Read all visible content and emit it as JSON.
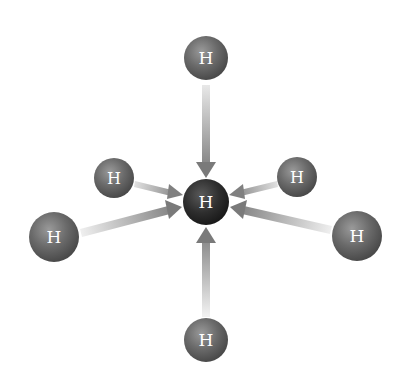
{
  "diagram": {
    "type": "molecular-interaction",
    "center_atom": {
      "label": "H",
      "x": 206,
      "y": 202,
      "r": 23,
      "fill": "#2e2e2e"
    },
    "outer_atoms": [
      {
        "id": "top",
        "label": "H",
        "x": 206,
        "y": 58,
        "r": 22
      },
      {
        "id": "upper-left",
        "label": "H",
        "x": 114,
        "y": 178,
        "r": 20
      },
      {
        "id": "upper-right",
        "label": "H",
        "x": 297,
        "y": 177,
        "r": 20
      },
      {
        "id": "left",
        "label": "H",
        "x": 54,
        "y": 237,
        "r": 25
      },
      {
        "id": "right",
        "label": "H",
        "x": 357,
        "y": 236,
        "r": 25
      },
      {
        "id": "bottom",
        "label": "H",
        "x": 206,
        "y": 340,
        "r": 22
      }
    ],
    "arrow_direction": "outer-to-center",
    "colors": {
      "background": "#ffffff",
      "atom_fill": "#6a6a6a",
      "atom_highlight": "#9a9a9a",
      "center_fill": "#2e2e2e",
      "arrow_dark": "#7a7a7a",
      "arrow_light": "#e8e8e8",
      "label": "#ffffff"
    }
  }
}
